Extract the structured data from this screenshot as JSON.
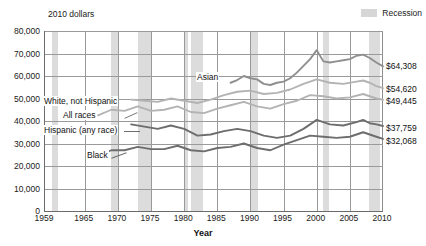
{
  "title": "",
  "axis_unit_label": "2010 dollars",
  "legend": {
    "recession_label": "Recession",
    "swatch_color": "#d6d6d6"
  },
  "xaxis_title": "Year",
  "yticks": [
    "80,000",
    "70,000",
    "60,000",
    "50,000",
    "40,000",
    "30,000",
    "20,000",
    "10,000",
    "0"
  ],
  "xticks": [
    "1959",
    "1965",
    "1970",
    "1975",
    "1980",
    "1985",
    "1990",
    "1995",
    "2000",
    "2005",
    "2010"
  ],
  "series_labels": {
    "asian": "Asian",
    "white_not_hispanic": "White, not Hispanic",
    "all_races": "All races",
    "hispanic": "Hispanic (any race)",
    "black": "Black"
  },
  "end_values": {
    "asian": "$64,308",
    "white_not_hispanic": "$54,620",
    "all_races": "$49,445",
    "hispanic": "$37,759",
    "black": "$32,068"
  },
  "chart_data": {
    "type": "line",
    "title": "",
    "xlabel": "Year",
    "ylabel": "2010 dollars",
    "xlim": [
      1959,
      2010
    ],
    "ylim": [
      0,
      80000
    ],
    "ytick_values": [
      0,
      10000,
      20000,
      30000,
      40000,
      50000,
      60000,
      70000,
      80000
    ],
    "xtick_values": [
      1959,
      1965,
      1970,
      1975,
      1980,
      1985,
      1990,
      1995,
      2000,
      2005,
      2010
    ],
    "grid": true,
    "legend_position": "top-right",
    "annotations": [
      {
        "text": "Recession",
        "type": "band-legend"
      },
      {
        "text": "$64,308",
        "series": "Asian",
        "year": 2010
      },
      {
        "text": "$54,620",
        "series": "White, not Hispanic",
        "year": 2010
      },
      {
        "text": "$49,445",
        "series": "All races",
        "year": 2010
      },
      {
        "text": "$37,759",
        "series": "Hispanic (any race)",
        "year": 2010
      },
      {
        "text": "$32,068",
        "series": "Black",
        "year": 2010
      }
    ],
    "recession_bands": [
      [
        1960,
        1961
      ],
      [
        1969,
        1970
      ],
      [
        1973,
        1975
      ],
      [
        1980,
        1980.6
      ],
      [
        1981,
        1982.9
      ],
      [
        1990,
        1991.2
      ],
      [
        2001,
        2001.9
      ],
      [
        2007.9,
        2009.5
      ]
    ],
    "series": [
      {
        "name": "Asian",
        "color": "#8f8f8f",
        "x": [
          1987,
          1988,
          1989,
          1990,
          1991,
          1992,
          1993,
          1994,
          1995,
          1996,
          1997,
          1998,
          1999,
          2000,
          2001,
          2002,
          2003,
          2004,
          2005,
          2006,
          2007,
          2008,
          2009,
          2010
        ],
        "values": [
          57000,
          58200,
          60000,
          59000,
          58500,
          56500,
          56000,
          57000,
          57500,
          59000,
          61500,
          64500,
          67500,
          71500,
          66500,
          66000,
          66500,
          67000,
          67500,
          69000,
          69500,
          68000,
          66000,
          64308
        ]
      },
      {
        "name": "White, not Hispanic",
        "color": "#b3b3b3",
        "x": [
          1972,
          1974,
          1976,
          1978,
          1980,
          1982,
          1984,
          1986,
          1988,
          1990,
          1992,
          1994,
          1996,
          1998,
          2000,
          2002,
          2004,
          2006,
          2007,
          2008,
          2009,
          2010
        ],
        "values": [
          49500,
          49000,
          48500,
          50000,
          49000,
          48000,
          49500,
          51500,
          53000,
          53500,
          52000,
          52500,
          54000,
          56500,
          58500,
          57000,
          56500,
          57500,
          58000,
          57000,
          55500,
          54620
        ]
      },
      {
        "name": "All races",
        "color": "#b3b3b3",
        "x": [
          1967,
          1969,
          1971,
          1973,
          1975,
          1977,
          1979,
          1981,
          1983,
          1985,
          1987,
          1989,
          1991,
          1993,
          1995,
          1997,
          1999,
          2001,
          2003,
          2005,
          2007,
          2008,
          2009,
          2010
        ],
        "values": [
          42500,
          45000,
          44500,
          46500,
          44500,
          45000,
          46500,
          44000,
          43500,
          45500,
          47000,
          48500,
          46500,
          45500,
          47500,
          49000,
          51500,
          51000,
          50000,
          50500,
          52000,
          51000,
          50000,
          49445
        ]
      },
      {
        "name": "Hispanic (any race)",
        "color": "#6d6d6d",
        "x": [
          1972,
          1974,
          1976,
          1978,
          1980,
          1982,
          1984,
          1986,
          1988,
          1990,
          1992,
          1994,
          1996,
          1998,
          2000,
          2002,
          2004,
          2006,
          2007,
          2008,
          2009,
          2010
        ],
        "values": [
          38500,
          37500,
          36500,
          38000,
          36500,
          33500,
          34000,
          35500,
          36500,
          35500,
          33500,
          32500,
          33500,
          36500,
          40500,
          38500,
          38000,
          39500,
          40500,
          39000,
          38500,
          37759
        ]
      },
      {
        "name": "Black",
        "color": "#6d6d6d",
        "x": [
          1967,
          1969,
          1971,
          1973,
          1975,
          1977,
          1979,
          1981,
          1983,
          1985,
          1987,
          1989,
          1991,
          1993,
          1995,
          1997,
          1999,
          2001,
          2003,
          2005,
          2007,
          2008,
          2009,
          2010
        ],
        "values": [
          24500,
          27000,
          27000,
          28500,
          27500,
          27500,
          29000,
          27000,
          26500,
          28000,
          28500,
          30000,
          28000,
          27000,
          29500,
          31500,
          33500,
          33000,
          32500,
          33000,
          35000,
          34000,
          33000,
          32068
        ]
      }
    ]
  }
}
